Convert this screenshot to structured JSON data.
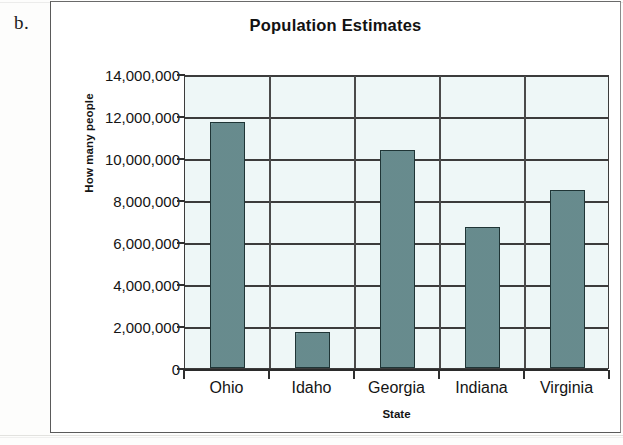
{
  "figure": {
    "item_label": "b."
  },
  "chart_data": {
    "type": "bar",
    "title": "Population Estimates",
    "xlabel": "State",
    "ylabel": "How many people",
    "categories": [
      "Ohio",
      "Idaho",
      "Georgia",
      "Indiana",
      "Virginia"
    ],
    "values": [
      11700000,
      1700000,
      10400000,
      6700000,
      8500000
    ],
    "ylim": [
      0,
      14000000
    ],
    "ytick_step": 2000000,
    "ytick_labels": [
      "14,000,000",
      "12,000,000",
      "10,000,000",
      "8,000,000",
      "6,000,000",
      "4,000,000",
      "2,000,000",
      "0"
    ],
    "ytick_values": [
      14000000,
      12000000,
      10000000,
      8000000,
      6000000,
      4000000,
      2000000,
      0
    ],
    "grid": true,
    "legend": false,
    "colors": {
      "bar_fill": "#6d9295",
      "bar_border": "#1f3536",
      "plot_background": "#eef7f7",
      "axis": "#3c3c3c",
      "text": "#141414"
    }
  }
}
